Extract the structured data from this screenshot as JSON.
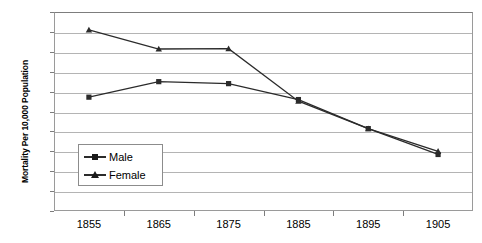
{
  "chart_data": {
    "type": "line",
    "title": "",
    "xlabel": "",
    "ylabel": "Mortality Per 10,000 Population",
    "categories": [
      "1855",
      "1865",
      "1875",
      "1885",
      "1895",
      "1905"
    ],
    "series": [
      {
        "name": "Male",
        "marker": "square",
        "values": [
          28.6,
          32.5,
          32.0,
          28.0,
          20.7,
          14.2
        ]
      },
      {
        "name": "Female",
        "marker": "triangle",
        "values": [
          45.5,
          40.7,
          40.8,
          27.6,
          20.7,
          15.0
        ]
      }
    ],
    "ylim": [
      0,
      50
    ],
    "ytick_step": 5,
    "yticks": [
      "0",
      "5",
      "10",
      "15",
      "20",
      "25",
      "30",
      "35",
      "40",
      "45",
      "50"
    ],
    "grid": true,
    "legend_position": "inside-left-center",
    "colors": {
      "line": "#2b2b2b",
      "grid": "#b4b4b4",
      "axis": "#7d7d7d",
      "text": "#000000"
    }
  },
  "legend": {
    "entries": [
      {
        "label": "Male"
      },
      {
        "label": "Female"
      }
    ]
  }
}
